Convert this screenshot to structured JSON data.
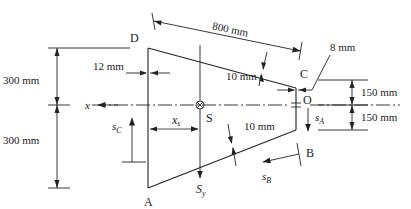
{
  "diagram": {
    "type": "thin-walled trapezoidal section with shear center",
    "points": {
      "D": "D",
      "C": "C",
      "B": "B",
      "A": "A",
      "O": "O",
      "S": "S"
    },
    "dimensions": {
      "slant_length": "800 mm",
      "top_half_height_left": "300 mm",
      "bottom_half_height_left": "300 mm",
      "top_half_height_right": "150 mm",
      "bottom_half_height_right": "150 mm",
      "web_thickness_left": "12 mm",
      "flange_thickness_top": "10 mm",
      "flange_thickness_bottom": "10 mm",
      "web_thickness_right": "8 mm"
    },
    "axes": {
      "x": "x",
      "sy_main": "S",
      "sy_sub": "y",
      "xs_main": "x",
      "xs_sub": "s"
    },
    "coordinates": {
      "sA_main": "s",
      "sA_sub": "A",
      "sB_main": "s",
      "sB_sub": "B",
      "sC_main": "s",
      "sC_sub": "C"
    },
    "colors": {
      "line": "#222222",
      "background": "#ffffff"
    }
  }
}
